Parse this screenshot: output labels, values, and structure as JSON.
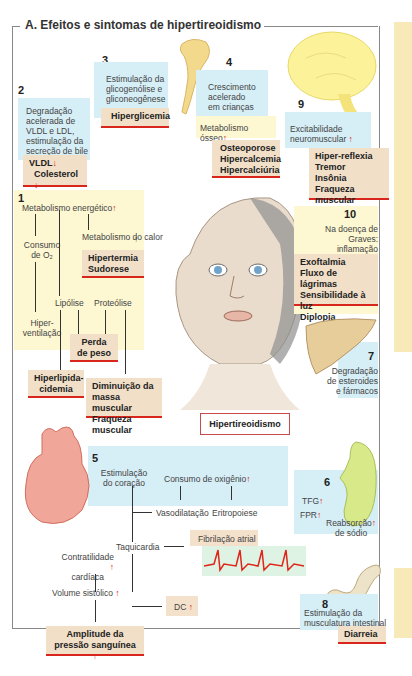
{
  "title": "A. Efeitos e sintomas de hipertireoidismo",
  "center_label": "Hipertireoidismo",
  "colors": {
    "accent_red": "#e01b10",
    "box_blue": "#d6eef6",
    "box_yellow": "#fdf7d2",
    "box_tan": "#f1dfc8"
  },
  "sections": {
    "s1": {
      "number": "1",
      "metabolism": "Metabolismo energético",
      "heat": "Metabolismo do calor",
      "heat_result": [
        "Hipertermia",
        "Sudorese"
      ],
      "o2": "Consumo de O₂",
      "hyperventilation": "Hiper-ventilação",
      "lipolysis": "Lipólise",
      "proteolysis": "Proteólise",
      "weight_loss": [
        "Perda",
        "de peso"
      ],
      "hyperlipid": [
        "Hiperlipida-",
        "cidemia"
      ],
      "muscle": [
        "Diminuição da",
        "massa muscular",
        "Fraqueza muscular"
      ]
    },
    "s2": {
      "number": "2",
      "text": [
        "Degradação",
        "acelerada de",
        "VLDL e LDL,",
        "estimulação da",
        "secreção de bile"
      ],
      "result": [
        "VLDL",
        "Colesterol"
      ]
    },
    "s3": {
      "number": "3",
      "text": [
        "Estimulação da",
        "glicogenólise e",
        "gliconeogênese"
      ],
      "result": "Hiperglicemia"
    },
    "s4": {
      "number": "4",
      "text": [
        "Crescimento",
        "acelerado",
        "em crianças"
      ],
      "metabolism": "Metabolismo ósseo",
      "result": [
        "Osteoporose",
        "Hipercalcemia",
        "Hipercalciúria"
      ]
    },
    "s5": {
      "number": "5",
      "heart_stim": [
        "Estimulação",
        "do coração"
      ],
      "o2_consumption": "Consumo de oxigênio",
      "vasodilation": "Vasodilatação",
      "erythropoiesis": "Eritropoiese",
      "tachycardia": "Taquicardia",
      "atrial_fib": "Fibrilação atrial",
      "contractility": [
        "Contratilidade",
        "cardíaca"
      ],
      "stroke_volume": "Volume sistólico",
      "cardiac_output": "DC",
      "pulse_pressure": [
        "Amplitude da",
        "pressão sanguínea"
      ]
    },
    "s6": {
      "number": "6",
      "tfg": "TFG",
      "fpr": "FPR",
      "reabsorption": [
        "Reabsorção",
        "de sódio"
      ]
    },
    "s7": {
      "number": "7",
      "text": [
        "Degradação",
        "de esteroides",
        "e fármacos"
      ]
    },
    "s8": {
      "number": "8",
      "text": [
        "Estimulação da",
        "musculatura intestinal"
      ],
      "result": "Diarreia"
    },
    "s9": {
      "number": "9",
      "text": [
        "Excitabilidade",
        "neuromuscular"
      ],
      "result": [
        "Hiper-reflexia",
        "Tremor",
        "Insônia",
        "Fraqueza muscular"
      ]
    },
    "s10": {
      "number": "10",
      "text": [
        "Na doença de Graves:",
        "inflamação retrobulbar"
      ],
      "result": [
        "Exoftalmia",
        "Fluxo de lágrimas",
        "Sensibilidade à luz",
        "Diplopia"
      ]
    }
  },
  "symbols": {
    "up": "↑",
    "down": "↓"
  }
}
